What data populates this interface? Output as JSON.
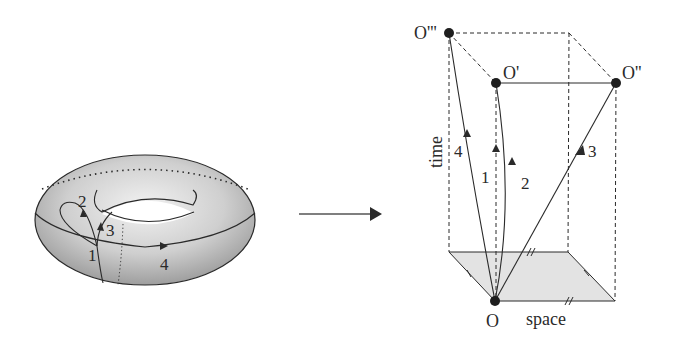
{
  "torus": {
    "path_labels": [
      "1",
      "2",
      "3",
      "4"
    ]
  },
  "mapping_arrow": {
    "direction": "right"
  },
  "spacetime": {
    "axis_time": "time",
    "axis_space": "space",
    "events": {
      "origin": "O",
      "o_prime": "O'",
      "o_double_prime": "O''",
      "o_triple_prime": "O'''"
    },
    "worldline_labels": [
      "1",
      "2",
      "3",
      "4"
    ]
  },
  "colors": {
    "ink": "#2a2a2a",
    "torus_fill": "#c9c9c9",
    "floor_fill": "#e3e3e3"
  }
}
